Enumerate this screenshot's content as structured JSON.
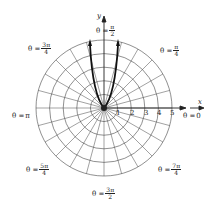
{
  "axes": {
    "x_label": "x",
    "y_label": "y"
  },
  "ticks": [
    "1",
    "2",
    "3",
    "4",
    "5"
  ],
  "angle_labels": {
    "a0": {
      "prefix": "θ =",
      "value": "0"
    },
    "api": {
      "prefix": "θ =",
      "value": "π"
    },
    "a1": {
      "prefix": "θ =",
      "num": "π",
      "den": "4"
    },
    "a2": {
      "prefix": "θ =",
      "num": "π",
      "den": "2"
    },
    "a3": {
      "prefix": "θ =",
      "num": "3π",
      "den": "4"
    },
    "a5": {
      "prefix": "θ =",
      "num": "5π",
      "den": "4"
    },
    "a6": {
      "prefix": "θ =",
      "num": "3π",
      "den": "2"
    },
    "a7": {
      "prefix": "θ =",
      "num": "7π",
      "den": "4"
    }
  }
}
